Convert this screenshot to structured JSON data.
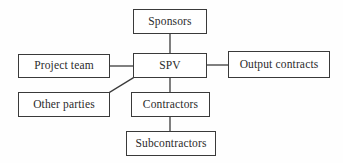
{
  "diagram": {
    "background_color": "#fefefe",
    "line_color": "#3a3a3a",
    "text_color": "#2b2b2b",
    "nodes": [
      {
        "id": "sponsors",
        "label": "Sponsors"
      },
      {
        "id": "spv",
        "label": "SPV"
      },
      {
        "id": "project_team",
        "label": "Project team"
      },
      {
        "id": "output_contracts",
        "label": "Output contracts"
      },
      {
        "id": "other_parties",
        "label": "Other parties"
      },
      {
        "id": "contractors",
        "label": "Contractors"
      },
      {
        "id": "subcontractors",
        "label": "Subcontractors"
      }
    ],
    "edges": [
      {
        "from": "sponsors",
        "to": "spv",
        "style": "vertical"
      },
      {
        "from": "project_team",
        "to": "spv",
        "style": "horizontal"
      },
      {
        "from": "spv",
        "to": "output_contracts",
        "style": "horizontal"
      },
      {
        "from": "other_parties",
        "to": "spv",
        "style": "diagonal"
      },
      {
        "from": "spv",
        "to": "contractors",
        "style": "vertical"
      },
      {
        "from": "contractors",
        "to": "subcontractors",
        "style": "vertical"
      }
    ]
  }
}
